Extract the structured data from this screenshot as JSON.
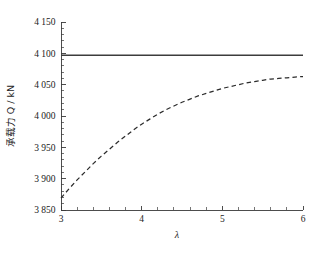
{
  "chart_data": {
    "type": "line",
    "title": "",
    "subtitle": "",
    "xlabel": "λ",
    "ylabel": "承载力 Q / kN",
    "xlim": [
      3,
      6
    ],
    "ylim": [
      3850,
      4150
    ],
    "xticks": [
      3,
      4,
      5,
      6
    ],
    "xtick_labels": [
      "3",
      "4",
      "5",
      "6"
    ],
    "yticks": [
      3850,
      3900,
      3950,
      4000,
      4050,
      4100,
      4150
    ],
    "ytick_labels": [
      "3 850",
      "3 900",
      "3 950",
      "4 000",
      "4 050",
      "4 100",
      "4 150"
    ],
    "x_minor_count": 4,
    "y_minor_count": 4,
    "grid": false,
    "legend": "none",
    "series": [
      {
        "name": "constant-reference",
        "style": "solid",
        "color": "#3c3c3c",
        "x": [
          3,
          6
        ],
        "values": [
          4097,
          4097
        ]
      },
      {
        "name": "computed-capacity",
        "style": "dashed",
        "color": "#2b2b2b",
        "x": [
          3.0,
          3.1,
          3.2,
          3.3,
          3.4,
          3.5,
          3.6,
          3.7,
          3.8,
          3.9,
          4.0,
          4.1,
          4.2,
          4.3,
          4.4,
          4.5,
          4.6,
          4.7,
          4.8,
          4.9,
          5.0,
          5.1,
          5.2,
          5.3,
          5.4,
          5.5,
          5.6,
          5.7,
          5.8,
          5.9,
          6.0
        ],
        "values": [
          3869,
          3884,
          3898,
          3911,
          3924,
          3936,
          3947,
          3958,
          3968,
          3978,
          3987,
          3995,
          4003,
          4010,
          4016,
          4022,
          4027,
          4032,
          4036,
          4040,
          4044,
          4047,
          4050,
          4053,
          4055,
          4057,
          4059,
          4060,
          4061,
          4062,
          4063
        ]
      }
    ]
  },
  "axes": {
    "x_axis_name": "lambda-axis",
    "y_axis_name": "bearing-capacity-axis"
  }
}
